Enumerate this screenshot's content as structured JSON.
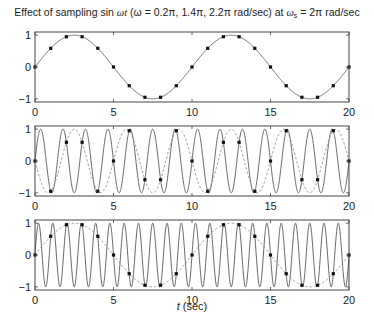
{
  "chart_data": {
    "type": "line",
    "title": "Effect of sampling sin ωt (ω = 0.2π, 1.4π, 2.2π rad/sec) at ωs = 2π rad/sec",
    "title_parts": {
      "prefix": "Effect of sampling sin ",
      "omega_t": "ωt",
      "middle": " (ω = 0.2π, 1.4π, 2.2π rad/sec) at ",
      "omega_s": "ω",
      "omega_s_sub": "s",
      "suffix": " = 2π rad/sec"
    },
    "xlabel_italic": "t",
    "xlabel_rest": " (sec)",
    "xlabel": "t (sec)",
    "sampling_period_sec": 1,
    "panels": [
      {
        "name": "omega-0.2pi",
        "xlim": [
          0,
          20
        ],
        "ylim": [
          -1.1,
          1.1
        ],
        "xticks": [
          0,
          5,
          10,
          15,
          20
        ],
        "yticks": [
          -1,
          0,
          1
        ],
        "xtick_labels": [
          "0",
          "5",
          "10",
          "15",
          "20"
        ],
        "ytick_labels": [
          "−1",
          "0",
          "1"
        ],
        "series": [
          {
            "name": "sin(0.2πt)",
            "style": "solid",
            "amplitude": 1,
            "omega_over_pi": 0.2,
            "kind": "continuous"
          },
          {
            "name": "samples",
            "style": "markers",
            "t": [
              0,
              1,
              2,
              3,
              4,
              5,
              6,
              7,
              8,
              9,
              10,
              11,
              12,
              13,
              14,
              15,
              16,
              17,
              18,
              19,
              20
            ],
            "values": [
              0,
              0.588,
              0.951,
              0.951,
              0.588,
              0,
              -0.588,
              -0.951,
              -0.951,
              -0.588,
              0,
              0.588,
              0.951,
              0.951,
              0.588,
              0,
              -0.588,
              -0.951,
              -0.951,
              -0.588,
              0
            ]
          }
        ]
      },
      {
        "name": "omega-1.4pi",
        "xlim": [
          0,
          20
        ],
        "ylim": [
          -1.1,
          1.1
        ],
        "xticks": [
          0,
          5,
          10,
          15,
          20
        ],
        "yticks": [
          -1,
          0,
          1
        ],
        "xtick_labels": [
          "0",
          "5",
          "10",
          "15",
          "20"
        ],
        "ytick_labels": [
          "−1",
          "0",
          "1"
        ],
        "series": [
          {
            "name": "sin(1.4πt)",
            "style": "solid",
            "amplitude": 1,
            "omega_over_pi": 1.4,
            "kind": "continuous"
          },
          {
            "name": "alias −sin(0.6πt)",
            "style": "dashed",
            "amplitude": -1,
            "omega_over_pi": 0.6,
            "kind": "continuous"
          },
          {
            "name": "samples",
            "style": "markers",
            "t": [
              0,
              1,
              2,
              3,
              4,
              5,
              6,
              7,
              8,
              9,
              10,
              11,
              12,
              13,
              14,
              15,
              16,
              17,
              18,
              19,
              20
            ],
            "values": [
              0,
              -0.951,
              0.588,
              0.588,
              -0.951,
              0,
              0.951,
              -0.588,
              -0.588,
              0.951,
              0,
              -0.951,
              0.588,
              0.588,
              -0.951,
              0,
              0.951,
              -0.588,
              -0.588,
              0.951,
              0
            ]
          }
        ]
      },
      {
        "name": "omega-2.2pi",
        "xlim": [
          0,
          20
        ],
        "ylim": [
          -1.1,
          1.1
        ],
        "xticks": [
          0,
          5,
          10,
          15,
          20
        ],
        "yticks": [
          -1,
          0,
          1
        ],
        "xtick_labels": [
          "0",
          "5",
          "10",
          "15",
          "20"
        ],
        "ytick_labels": [
          "−1",
          "0",
          "1"
        ],
        "series": [
          {
            "name": "sin(2.2πt)",
            "style": "solid",
            "amplitude": 1,
            "omega_over_pi": 2.2,
            "kind": "continuous"
          },
          {
            "name": "alias sin(0.2πt)",
            "style": "dashed",
            "amplitude": 1,
            "omega_over_pi": 0.2,
            "kind": "continuous"
          },
          {
            "name": "samples",
            "style": "markers",
            "t": [
              0,
              1,
              2,
              3,
              4,
              5,
              6,
              7,
              8,
              9,
              10,
              11,
              12,
              13,
              14,
              15,
              16,
              17,
              18,
              19,
              20
            ],
            "values": [
              0,
              0.588,
              0.951,
              0.951,
              0.588,
              0,
              -0.588,
              -0.951,
              -0.951,
              -0.588,
              0,
              0.588,
              0.951,
              0.951,
              0.588,
              0,
              -0.588,
              -0.951,
              -0.951,
              -0.588,
              0
            ]
          }
        ]
      }
    ],
    "colors": {
      "solid_line": "#555555",
      "dashed_line": "#888888",
      "marker": "#111111",
      "axes": "#444444"
    },
    "grid": false,
    "legend": "none"
  }
}
